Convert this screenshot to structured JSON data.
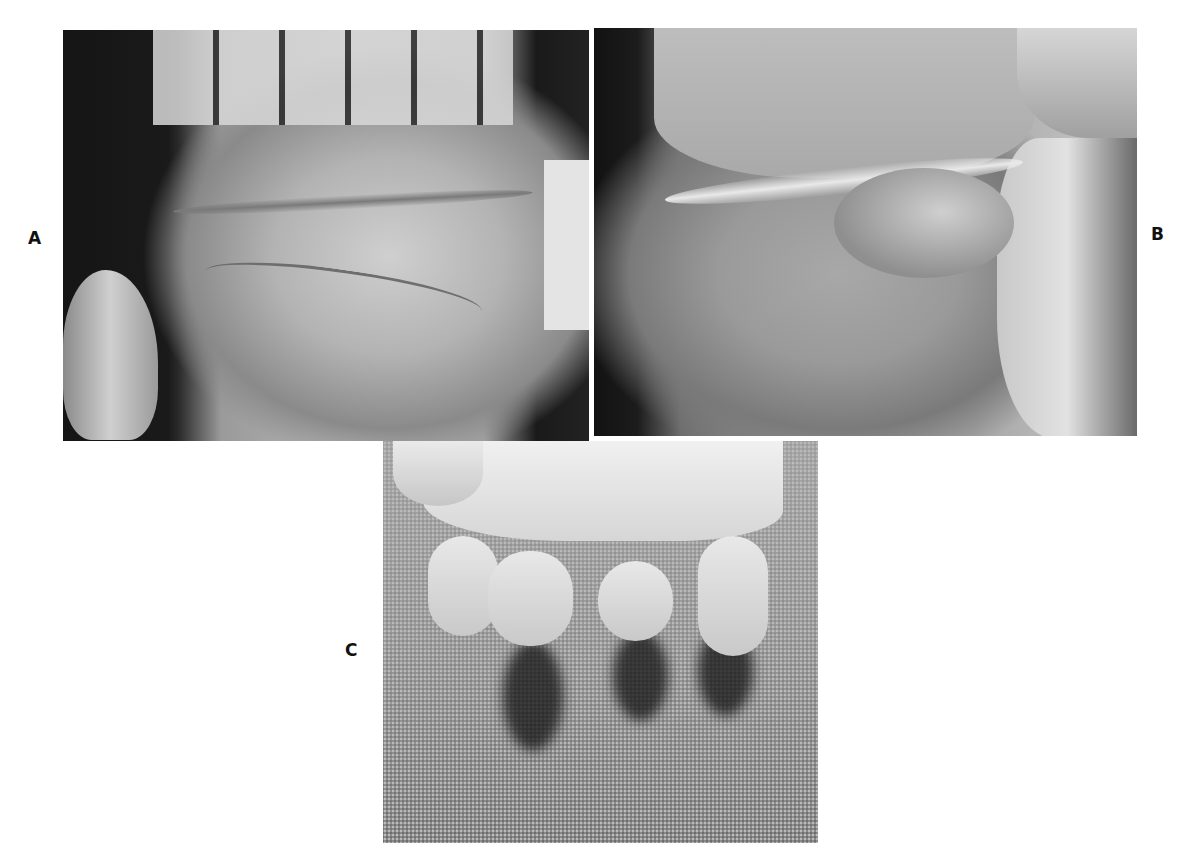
{
  "figure": {
    "panels": [
      {
        "id": "A",
        "label": "A",
        "description": "Photograph of infant palm with thumb held aside"
      },
      {
        "id": "B",
        "label": "B",
        "description": "Photograph of infant palm with thumb flexed across palm"
      },
      {
        "id": "C",
        "label": "C",
        "description": "Photograph of infant hand resting on textured fabric, fingers curled"
      }
    ]
  }
}
